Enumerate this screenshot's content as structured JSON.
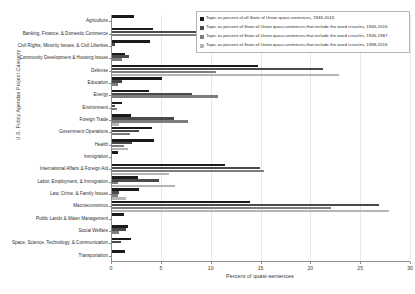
{
  "chart_data": {
    "type": "bar",
    "orientation": "horizontal",
    "title": "",
    "xlabel": "Percent of quasi-sentences",
    "ylabel": "U.S. Policy Agendas Project Category",
    "xlim": [
      0,
      30
    ],
    "xticks": [
      0,
      5,
      10,
      15,
      20,
      25,
      30
    ],
    "xtick_labels": [
      "0",
      "5",
      "10",
      "15",
      "20",
      "25",
      "30"
    ],
    "grid": true,
    "legend_position": "top-right",
    "categories": [
      "Agriculture",
      "Banking, Finance, & Domestic Commerce",
      "Civil Rights, Minority Issues, & Civil Liberties",
      "Community Development & Housing Issues",
      "Defense",
      "Education",
      "Energy",
      "Environment",
      "Foreign Trade",
      "Government Operations",
      "Health",
      "Immigration",
      "International Affairs & Foreign Aid",
      "Labor, Employment, & Immigration",
      "Law, Crime, & Family Issues",
      "Macroeconomics",
      "Public Lands & Water Management",
      "Social Welfare",
      "Space, Science, Technology, & Communication",
      "Transportation"
    ],
    "series": [
      {
        "name": "Topic as percent of all State of Union quasi-sentences, 1946-2016",
        "color": "#1a1a1a",
        "values": [
          2.2,
          4.1,
          3.8,
          1.3,
          14.6,
          5.0,
          3.7,
          1.0,
          1.9,
          4.0,
          4.2,
          0.6,
          11.3,
          2.6,
          2.7,
          13.8,
          1.2,
          1.6,
          1.9,
          1.3
        ]
      },
      {
        "name": "Topic as percent of State of Union quasi-sentences that include the word crisis/es, 1946-2016",
        "color": "#4a4a4a",
        "values": [
          0.0,
          9.3,
          0.3,
          1.7,
          21.2,
          1.0,
          8.0,
          0.3,
          6.2,
          2.7,
          2.0,
          0.0,
          14.8,
          4.7,
          0.7,
          26.8,
          0.0,
          1.4,
          0.9,
          0.0
        ]
      },
      {
        "name": "Topic as percent of State of Union quasi-sentences that include the word crisis/es, 1946-1987",
        "color": "#7d7d7d",
        "values": [
          0.0,
          11.9,
          0.0,
          1.0,
          10.4,
          0.6,
          10.6,
          0.5,
          7.6,
          1.8,
          1.2,
          0.0,
          15.3,
          0.6,
          0.6,
          22.0,
          0.0,
          0.7,
          0.0,
          0.0
        ]
      },
      {
        "name": "Topic as percent of State of Union quasi-sentences that include the word crisis/es, 1988-2016",
        "color": "#b5b5b5",
        "values": [
          0.0,
          0.0,
          0.0,
          0.0,
          22.8,
          0.0,
          0.0,
          0.0,
          0.7,
          0.0,
          1.6,
          0.0,
          5.7,
          6.3,
          1.4,
          27.8,
          0.0,
          0.0,
          0.0,
          0.0
        ]
      }
    ]
  }
}
